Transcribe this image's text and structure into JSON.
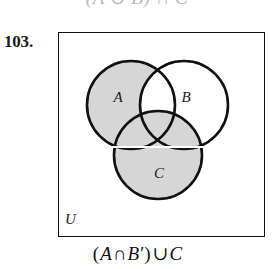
{
  "header": {
    "cutoff_text": "(A ∪ B) ∩ C"
  },
  "problem": {
    "number_label": "103."
  },
  "diagram": {
    "universe_label": "U",
    "set_labels": {
      "a": "A",
      "b": "B",
      "c": "C"
    },
    "circles": [
      {
        "id": "A",
        "label": "A",
        "cx": 73,
        "cy": 73,
        "r": 44,
        "shaded": true,
        "label_x": 60,
        "label_y": 70
      },
      {
        "id": "B",
        "label": "B",
        "cx": 126,
        "cy": 73,
        "r": 44,
        "shaded": false,
        "label_x": 128,
        "label_y": 70
      },
      {
        "id": "C",
        "label": "C",
        "cx": 100,
        "cy": 123,
        "r": 44,
        "shaded": true,
        "label_x": 101,
        "label_y": 146
      }
    ],
    "shaded_description": "A minus B, union all of C",
    "colors": {
      "shade_fill": "#d6d6d6",
      "stroke": "#111111",
      "page_background": "#ffffff",
      "border": "#111111",
      "text": "#1a1a1a"
    }
  },
  "expression": {
    "full_text": "(A ∩ B′) ∪ C",
    "tokens": [
      {
        "text": "(",
        "italic": false
      },
      {
        "text": "A",
        "italic": true
      },
      {
        "text": "∩",
        "italic": false
      },
      {
        "text": "B′",
        "italic": true
      },
      {
        "text": ")",
        "italic": false
      },
      {
        "text": "∪",
        "italic": false
      },
      {
        "text": "C",
        "italic": true
      }
    ],
    "open_paren": "(",
    "set_a": "A",
    "intersect": "∩",
    "set_b_complement": "B′",
    "close_paren": ")",
    "union": "∪",
    "set_c": "C"
  }
}
